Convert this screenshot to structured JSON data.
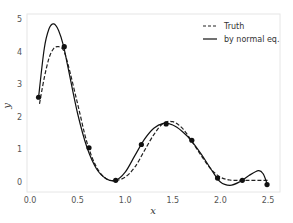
{
  "chart_data": {
    "type": "line",
    "title": "",
    "xlabel": "x",
    "ylabel": "y",
    "xlim": [
      0.0,
      2.6
    ],
    "ylim": [
      -0.3,
      5.0
    ],
    "xticks": [
      0.0,
      0.5,
      1.0,
      1.5,
      2.0,
      2.5
    ],
    "xtick_labels": [
      "0.0",
      "0.5",
      "1.0",
      "1.5",
      "2.0",
      "2.5"
    ],
    "yticks": [
      0,
      1,
      2,
      3,
      4,
      5
    ],
    "ytick_labels": [
      "0",
      "1",
      "2",
      "3",
      "4",
      "5"
    ],
    "grid": false,
    "legend_position": "upper right",
    "legend": [
      "Truth",
      "by normal eq."
    ],
    "series": [
      {
        "name": "Truth",
        "style": "dashed",
        "color": "#222222",
        "x": [
          0.1,
          0.15,
          0.2,
          0.25,
          0.3,
          0.35,
          0.4,
          0.5,
          0.6,
          0.7,
          0.8,
          0.9,
          1.0,
          1.1,
          1.2,
          1.3,
          1.4,
          1.5,
          1.6,
          1.7,
          1.8,
          1.9,
          2.0,
          2.1,
          2.2,
          2.3,
          2.4,
          2.5
        ],
        "y": [
          2.4,
          3.2,
          3.8,
          4.1,
          4.15,
          4.05,
          3.6,
          2.4,
          1.2,
          0.45,
          0.1,
          0.05,
          0.15,
          0.45,
          0.95,
          1.45,
          1.8,
          1.85,
          1.65,
          1.25,
          0.8,
          0.4,
          0.15,
          0.06,
          0.05,
          0.05,
          0.05,
          0.05
        ]
      },
      {
        "name": "by normal eq.",
        "style": "solid",
        "color": "#111111",
        "x": [
          0.09,
          0.15,
          0.2,
          0.25,
          0.3,
          0.35,
          0.4,
          0.5,
          0.6,
          0.7,
          0.8,
          0.9,
          1.0,
          1.1,
          1.2,
          1.3,
          1.4,
          1.5,
          1.6,
          1.7,
          1.8,
          1.9,
          2.0,
          2.1,
          2.2,
          2.3,
          2.4,
          2.45,
          2.49
        ],
        "y": [
          2.6,
          4.1,
          4.7,
          4.85,
          4.65,
          4.2,
          3.5,
          2.1,
          1.05,
          0.4,
          0.1,
          0.05,
          0.3,
          0.8,
          1.3,
          1.65,
          1.8,
          1.75,
          1.55,
          1.25,
          0.85,
          0.4,
          0.0,
          -0.1,
          0.0,
          0.2,
          0.35,
          0.25,
          -0.05
        ]
      },
      {
        "name": "samples",
        "style": "markers",
        "color": "#111111",
        "x": [
          0.09,
          0.36,
          0.62,
          0.9,
          1.17,
          1.43,
          1.7,
          1.97,
          2.23,
          2.49
        ],
        "y": [
          2.6,
          4.15,
          1.05,
          0.05,
          1.15,
          1.78,
          1.28,
          0.12,
          0.05,
          -0.08
        ]
      }
    ]
  }
}
